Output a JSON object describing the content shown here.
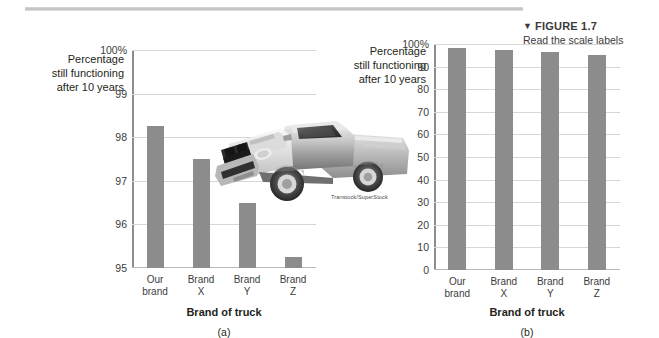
{
  "figure": {
    "marker": "▼",
    "title": "FIGURE 1.7",
    "subtitle": "Read the scale labels"
  },
  "photo": {
    "credit": "Transtock/SuperStock",
    "alt_name": "pickup-truck-photo"
  },
  "colors": {
    "bar": "#8c8c8c",
    "gridline": "#d6d6d6",
    "axis": "#8d8d8d",
    "text": "#231f20",
    "rule": "#bdbdbd"
  },
  "chart_data": [
    {
      "type": "bar",
      "panel": "(a)",
      "title": "",
      "categories": [
        "Our\nbrand",
        "Brand\nX",
        "Brand\nY",
        "Brand\nZ"
      ],
      "values": [
        98.25,
        97.5,
        96.5,
        95.25
      ],
      "xlabel": "Brand of truck",
      "ylabel": "Percentage\nstill functioning\nafter 10 years",
      "ylim": [
        95,
        100
      ],
      "yticks": [
        95,
        96,
        97,
        98,
        99,
        100
      ],
      "ytick_labels": [
        "95",
        "96",
        "97",
        "98",
        "99",
        "100%"
      ],
      "grid": true,
      "legend": "none"
    },
    {
      "type": "bar",
      "panel": "(b)",
      "title": "",
      "categories": [
        "Our\nbrand",
        "Brand\nX",
        "Brand\nY",
        "Brand\nZ"
      ],
      "values": [
        98.25,
        97.5,
        96.5,
        95.25
      ],
      "xlabel": "Brand of truck",
      "ylabel": "Percentage\nstill functioning\nafter 10 years",
      "ylim": [
        0,
        100
      ],
      "yticks": [
        0,
        10,
        20,
        30,
        40,
        50,
        60,
        70,
        80,
        90,
        100
      ],
      "ytick_labels": [
        "0",
        "10",
        "20",
        "30",
        "40",
        "50",
        "60",
        "70",
        "80",
        "90",
        "100%"
      ],
      "grid": true,
      "legend": "none"
    }
  ]
}
